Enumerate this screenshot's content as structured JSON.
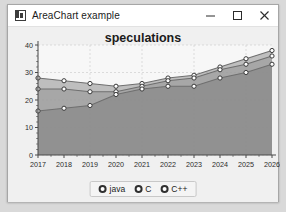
{
  "window": {
    "title": "AreaChart example",
    "icon": "app-chart-icon",
    "controls": [
      {
        "name": "minimize-button",
        "glyph": "minimize-icon"
      },
      {
        "name": "maximize-button",
        "glyph": "maximize-icon"
      },
      {
        "name": "close-button",
        "glyph": "close-icon"
      }
    ]
  },
  "colors": {
    "window_bg": "#f0f0f0",
    "titlebar_bg": "#ffffff",
    "plot_bg": "#f7f7f7",
    "grid": "#cfcfcf",
    "axis": "#4a4a4a",
    "series_java": "#8f8f8f",
    "series_c": "#9a9a9a",
    "series_cpp": "#8a8a8a",
    "marker_fill": "#ffffff",
    "marker_stroke": "#3a3a3a"
  },
  "chart_data": {
    "type": "area",
    "title": "speculations",
    "xlabel": "",
    "ylabel": "",
    "xlim": [
      2017,
      2026
    ],
    "ylim": [
      0,
      40
    ],
    "yticks": [
      0,
      10,
      20,
      30,
      40
    ],
    "grid": true,
    "legend_position": "bottom",
    "categories": [
      2017,
      2018,
      2019,
      2020,
      2021,
      2022,
      2023,
      2024,
      2025,
      2026
    ],
    "series": [
      {
        "name": "java",
        "values": [
          28,
          27,
          26,
          25,
          26,
          28,
          29,
          32,
          35,
          38
        ]
      },
      {
        "name": "C",
        "values": [
          24,
          24,
          23,
          23,
          25,
          27,
          28,
          31,
          33,
          36
        ]
      },
      {
        "name": "C++",
        "values": [
          16,
          17,
          18,
          22,
          24,
          25,
          25,
          28,
          30,
          33
        ]
      }
    ]
  }
}
